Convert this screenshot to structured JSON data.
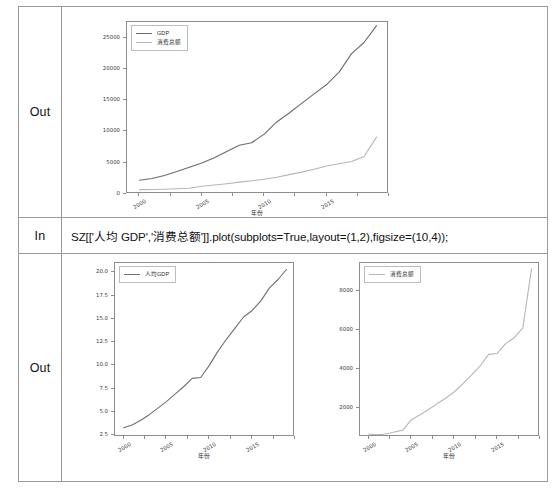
{
  "notebook": {
    "rows": [
      {
        "gutter_label": "Out",
        "kind": "figure"
      },
      {
        "gutter_label": "In",
        "kind": "code"
      },
      {
        "gutter_label": "Out",
        "kind": "figure"
      }
    ],
    "code_line": "SZ[['人均 GDP','消费总额']].plot(subplots=True,layout=(1,2),figsize=(10,4));"
  },
  "colors": {
    "gdp_line": "#6a6a70",
    "consumption_line": "#b6b6bb",
    "percapita_line": "#6f6f75",
    "axis": "#8d8d8d",
    "text": "#2e2e2e",
    "border": "#9a9a9a"
  },
  "chart_data": [
    {
      "id": "combined",
      "type": "line",
      "title": "",
      "xlabel": "年份",
      "ylabel": "",
      "grid": false,
      "legend_position": "upper left",
      "xlim": [
        1999,
        2020
      ],
      "ylim": [
        0,
        27500
      ],
      "xticks": [
        "2000",
        "2005",
        "2010",
        "2015"
      ],
      "xtick_values": [
        2000,
        2005,
        2010,
        2015
      ],
      "yticks": [
        "0",
        "5000",
        "10000",
        "15000",
        "20000",
        "25000"
      ],
      "ytick_values": [
        0,
        5000,
        10000,
        15000,
        20000,
        25000
      ],
      "x": [
        2000,
        2001,
        2002,
        2003,
        2004,
        2005,
        2006,
        2007,
        2008,
        2009,
        2010,
        2011,
        2012,
        2013,
        2014,
        2015,
        2016,
        2017,
        2018,
        2019
      ],
      "series": [
        {
          "name": "GDP",
          "values": [
            2187,
            2482,
            2969,
            3585,
            4282,
            4951,
            5814,
            6802,
            7787,
            8201,
            9581,
            11516,
            12950,
            14500,
            16002,
            17503,
            19493,
            22438,
            24222,
            26927
          ]
        },
        {
          "name": "消费总额",
          "values": [
            702,
            715,
            769,
            835,
            920,
            1250,
            1430,
            1650,
            1905,
            2120,
            2364,
            2690,
            3100,
            3500,
            3970,
            4480,
            4830,
            5200,
            6000,
            9100
          ]
        }
      ]
    },
    {
      "id": "percapita",
      "type": "line",
      "title": "",
      "xlabel": "年份",
      "ylabel": "",
      "grid": false,
      "legend_position": "upper left",
      "xlim": [
        1999,
        2020
      ],
      "ylim": [
        2.3,
        21.0
      ],
      "xticks": [
        "2000",
        "2005",
        "2010",
        "2015"
      ],
      "xtick_values": [
        2000,
        2005,
        2010,
        2015
      ],
      "yticks": [
        "2.5",
        "5.0",
        "7.5",
        "10.0",
        "12.5",
        "15.0",
        "17.5",
        "20.0"
      ],
      "ytick_values": [
        2.5,
        5.0,
        7.5,
        10.0,
        12.5,
        15.0,
        17.5,
        20.0
      ],
      "x": [
        2000,
        2001,
        2002,
        2003,
        2004,
        2005,
        2006,
        2007,
        2008,
        2009,
        2010,
        2011,
        2012,
        2013,
        2014,
        2015,
        2016,
        2017,
        2018,
        2019
      ],
      "series": [
        {
          "name": "人均GDP",
          "values": [
            3.3,
            3.6,
            4.1,
            4.7,
            5.4,
            6.1,
            6.9,
            7.7,
            8.6,
            8.7,
            10.0,
            11.5,
            12.8,
            14.0,
            15.2,
            15.9,
            16.9,
            18.3,
            19.2,
            20.3
          ]
        }
      ]
    },
    {
      "id": "consumption",
      "type": "line",
      "title": "",
      "xlabel": "年份",
      "ylabel": "",
      "grid": false,
      "legend_position": "upper left",
      "xlim": [
        1999,
        2020
      ],
      "ylim": [
        550,
        9400
      ],
      "xticks": [
        "2000",
        "2005",
        "2010",
        "2015"
      ],
      "xtick_values": [
        2000,
        2005,
        2010,
        2015
      ],
      "yticks": [
        "2000",
        "4000",
        "6000",
        "8000"
      ],
      "ytick_values": [
        2000,
        4000,
        6000,
        8000
      ],
      "x": [
        2000,
        2001,
        2002,
        2003,
        2004,
        2005,
        2006,
        2007,
        2008,
        2009,
        2010,
        2011,
        2012,
        2013,
        2014,
        2015,
        2016,
        2017,
        2018,
        2019
      ],
      "series": [
        {
          "name": "消费总额",
          "values": [
            702,
            660,
            700,
            800,
            900,
            1430,
            1680,
            1950,
            2250,
            2520,
            2850,
            3250,
            3700,
            4150,
            4750,
            4800,
            5300,
            5600,
            6100,
            9100
          ]
        }
      ]
    }
  ]
}
